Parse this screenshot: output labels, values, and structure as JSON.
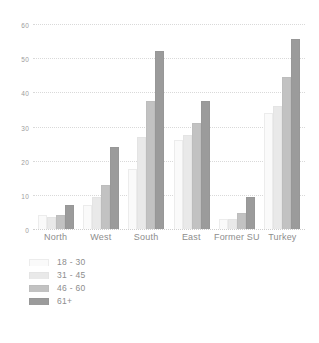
{
  "chart_data": {
    "type": "bar",
    "title": "",
    "subtitle": "",
    "xlabel": "",
    "ylabel": "",
    "categories": [
      "North",
      "West",
      "South",
      "East",
      "Former SU",
      "Turkey"
    ],
    "series": [
      {
        "name": "18 - 30",
        "color": "#fafafa",
        "values": [
          4,
          7,
          17.5,
          26,
          3,
          34
        ]
      },
      {
        "name": "31 - 45",
        "color": "#e9e9e9",
        "values": [
          3.5,
          9.5,
          27,
          27.5,
          3,
          36
        ]
      },
      {
        "name": "46 - 60",
        "color": "#c2c2c2",
        "values": [
          4,
          13,
          37.5,
          31,
          4.7,
          44.5
        ]
      },
      {
        "name": "61+",
        "color": "#9b9b9b",
        "values": [
          7,
          24,
          52,
          37.5,
          9.3,
          55.5
        ]
      }
    ],
    "ylim": [
      0,
      60
    ],
    "yticks": [
      0,
      10,
      20,
      30,
      40,
      50,
      60
    ],
    "ytick_labels": [
      "0",
      "10",
      "20",
      "30",
      "40",
      "50",
      "60"
    ],
    "grid": true,
    "grid_style": "dotted",
    "legend_position": "bottom-left",
    "background": "#ffffff"
  }
}
